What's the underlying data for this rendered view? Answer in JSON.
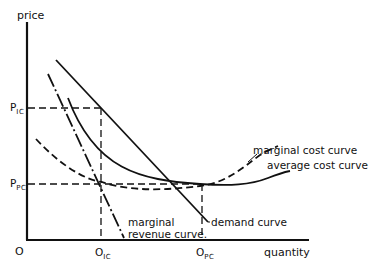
{
  "diagram": {
    "type": "economics-cost-curves",
    "axes": {
      "y_label": "price",
      "x_label": "quantity",
      "origin_label": "O"
    },
    "y_ticks": [
      {
        "main": "P",
        "sub": "IC"
      },
      {
        "main": "P",
        "sub": "PC"
      }
    ],
    "x_ticks": [
      {
        "main": "O",
        "sub": "IC"
      },
      {
        "main": "O",
        "sub": "PC"
      }
    ],
    "curves": {
      "marginal_cost": "marginal  cost  curve",
      "average_cost": "average  cost  curve",
      "demand": "demand  curve",
      "marginal_revenue_line1": "marginal",
      "marginal_revenue_line2": "revenue  curve."
    },
    "colors": {
      "ink": "#111111",
      "background": "#ffffff"
    }
  }
}
